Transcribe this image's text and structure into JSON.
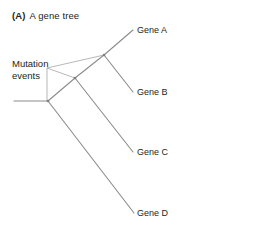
{
  "figure": {
    "panel_letter": "(A)",
    "caption": "A gene tree",
    "line_color": "#8c8c8c",
    "text_color": "#231f20",
    "background_color": "#ffffff"
  },
  "annotations": [
    {
      "name": "mutation-events",
      "text": "Mutation\nevents",
      "x": 12,
      "y": 58
    }
  ],
  "leaves": [
    {
      "name": "gene-a",
      "label": "Gene A",
      "x": 137,
      "y": 25
    },
    {
      "name": "gene-b",
      "label": "Gene B",
      "x": 137,
      "y": 87
    },
    {
      "name": "gene-c",
      "label": "Gene C",
      "x": 137,
      "y": 147
    },
    {
      "name": "gene-d",
      "label": "Gene D",
      "x": 137,
      "y": 208
    }
  ],
  "tree": {
    "nodes": [
      {
        "name": "root-node",
        "x": 48,
        "y": 101
      },
      {
        "name": "internal-node-1",
        "x": 75,
        "y": 78
      },
      {
        "name": "internal-node-2",
        "x": 104,
        "y": 55
      }
    ],
    "branches": [
      {
        "name": "root-stem",
        "x1": 14,
        "y1": 101,
        "x2": 48,
        "y2": 101
      },
      {
        "name": "branch-root-to-n1",
        "x1": 48,
        "y1": 101,
        "x2": 75,
        "y2": 78
      },
      {
        "name": "branch-root-to-d",
        "x1": 48,
        "y1": 101,
        "x2": 134,
        "y2": 213
      },
      {
        "name": "branch-n1-to-n2",
        "x1": 75,
        "y1": 78,
        "x2": 104,
        "y2": 55
      },
      {
        "name": "branch-n1-to-c",
        "x1": 75,
        "y1": 78,
        "x2": 133,
        "y2": 152
      },
      {
        "name": "branch-n2-to-a",
        "x1": 104,
        "y1": 55,
        "x2": 133,
        "y2": 30
      },
      {
        "name": "branch-n2-to-b",
        "x1": 104,
        "y1": 55,
        "x2": 133,
        "y2": 92
      }
    ],
    "leader_lines": [
      {
        "name": "leader-stem",
        "x1": 47,
        "y1": 68,
        "x2": 47,
        "y2": 101
      },
      {
        "name": "leader-to-n1",
        "x1": 47,
        "y1": 68,
        "x2": 75,
        "y2": 78
      },
      {
        "name": "leader-to-n2",
        "x1": 47,
        "y1": 68,
        "x2": 104,
        "y2": 55
      }
    ]
  }
}
